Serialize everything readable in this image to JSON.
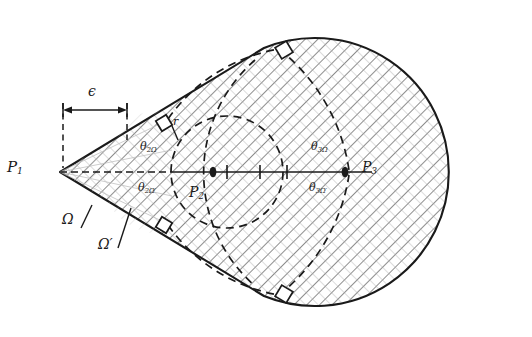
{
  "figure": {
    "type": "geometry-diagram",
    "colors": {
      "stroke": "#1a1a1a",
      "hatch": "#555555",
      "hatch_light": "#9a9a9a",
      "background": "#ffffff"
    }
  },
  "labels": {
    "p1": "P",
    "p1_sub": "1",
    "p2": "P",
    "p2_sub": "2",
    "p3": "P",
    "p3_sub": "3",
    "omega": "Ω",
    "omega_prime": "Ω′",
    "epsilon": "ϵ",
    "radius": "r",
    "theta2_omega_base": "θ",
    "theta2_omega_sub": "2Ω",
    "theta2_omega_prime_sub": "2Ω′",
    "theta3_omega_sub": "3Ω",
    "theta3_omega_prime_sub": "3Ω′"
  },
  "markers": {
    "right_angle_count": 4,
    "axis_tick_count": 3,
    "right_angle_label": "right-angle-marker"
  },
  "geometry": {
    "axis_y": 172,
    "p1_x": 60,
    "p2_x": 227,
    "p3_x": 358,
    "inner_circle_r": 56,
    "outer_circle_r": 134,
    "epsilon_left_x": 63,
    "epsilon_right_x": 127
  }
}
